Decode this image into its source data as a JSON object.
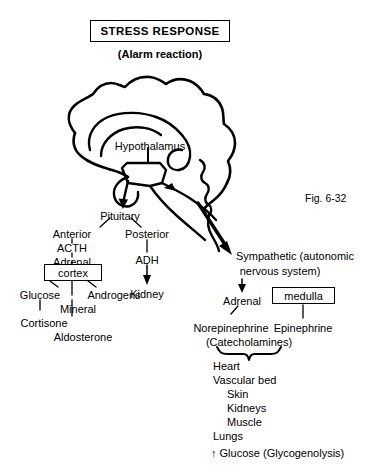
{
  "figure": {
    "title": "STRESS RESPONSE",
    "subtitle": "(Alarm reaction)",
    "number": "Fig. 6-32"
  },
  "brain": {
    "hypothalamus_label": "Hypothalamus",
    "pituitary_label": "Pituitary"
  },
  "endocrine_branch": {
    "anterior": "Anterior",
    "acth": "ACTH",
    "adrenal": "Adrenal",
    "cortex": "cortex",
    "hormones": {
      "glucose": "Glucose",
      "androgens": "Androgens",
      "mineral": "Mineral",
      "cortisone": "Cortisone",
      "aldosterone": "Aldosterone"
    }
  },
  "posterior_branch": {
    "posterior": "Posterior",
    "adh": "ADH",
    "kidney": "Kidney"
  },
  "sympathetic_branch": {
    "line1": "Sympathetic (autonomic",
    "line2": "nervous system)",
    "adrenal": "Adrenal",
    "medulla": "medulla",
    "norepinephrine": "Norepinephrine",
    "epinephrine": "Epinephrine",
    "catecholamines": "(Catecholamines)"
  },
  "targets": {
    "items": [
      "Heart",
      "Vascular bed",
      "Skin",
      "Kidneys",
      "Muscle",
      "Lungs"
    ],
    "metabolic_effect": "↑ Glucose (Glycogenolysis)"
  }
}
